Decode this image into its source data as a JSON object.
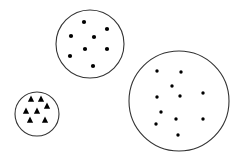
{
  "diagram": {
    "background": "#ffffff",
    "stroke_color": "#333333",
    "fill_color": "#000000",
    "groups": [
      {
        "name": "medium-circle",
        "cx": 90,
        "cy": 44,
        "r": 34,
        "marker": "dot",
        "marker_size": 2.1,
        "points": [
          [
            84,
            22
          ],
          [
            107,
            29
          ],
          [
            71,
            36
          ],
          [
            94,
            37
          ],
          [
            85,
            49
          ],
          [
            107,
            49
          ],
          [
            70,
            56
          ],
          [
            93,
            66
          ]
        ]
      },
      {
        "name": "small-circle",
        "cx": 37,
        "cy": 114,
        "r": 22,
        "marker": "triangle",
        "marker_size": 3.5,
        "points": [
          [
            31,
            99
          ],
          [
            41,
            99
          ],
          [
            47,
            106
          ],
          [
            26,
            111
          ],
          [
            37,
            111
          ],
          [
            30,
            120
          ],
          [
            45,
            120
          ]
        ]
      },
      {
        "name": "large-circle",
        "cx": 179,
        "cy": 101,
        "r": 50,
        "marker": "dot",
        "marker_size": 1.7,
        "points": [
          [
            157,
            71
          ],
          [
            181,
            72
          ],
          [
            172,
            86
          ],
          [
            157,
            97
          ],
          [
            180,
            96
          ],
          [
            203,
            93
          ],
          [
            161,
            112
          ],
          [
            176,
            119
          ],
          [
            203,
            119
          ],
          [
            156,
            124
          ],
          [
            178,
            135
          ]
        ]
      }
    ]
  }
}
